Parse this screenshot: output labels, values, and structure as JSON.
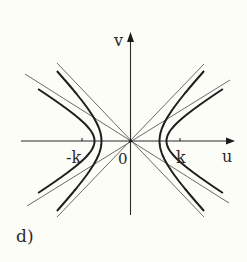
{
  "figure": {
    "panel_label": "d)",
    "axes": {
      "x_label": "u",
      "y_label": "v",
      "origin_label": "0",
      "tick_labels": [
        "-k",
        "k"
      ]
    },
    "curves": [
      {
        "name": "steep-hyperbola",
        "style": "thick",
        "vertex_u": 29,
        "b": 30
      },
      {
        "name": "shallow-hyperbola",
        "style": "thick",
        "vertex_u": 36,
        "b": 22
      }
    ],
    "asymptotes": [
      {
        "name": "steep-asymptotes",
        "slope": 1.04,
        "style": "thin"
      },
      {
        "name": "shallow-asymptotes",
        "slope": 0.61,
        "style": "thin"
      }
    ],
    "colors": {
      "background": "#fdfdf8",
      "ink": "#2a2a2a",
      "thin_line": "#6a6a6a"
    }
  }
}
